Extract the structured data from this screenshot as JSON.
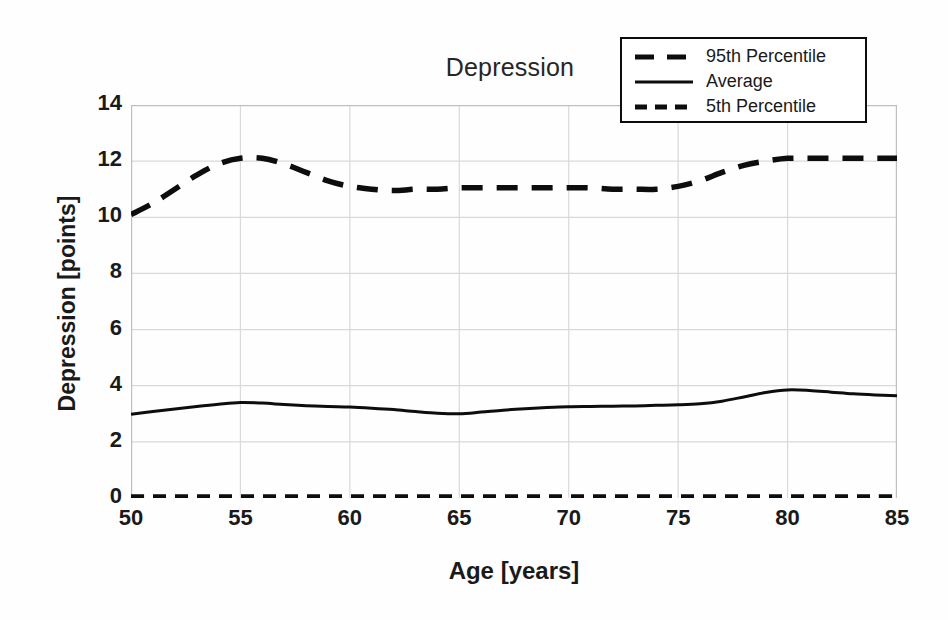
{
  "chart_data": {
    "type": "line",
    "title": "Depression",
    "xlabel": "Age [years]",
    "ylabel": "Depression [points]",
    "xlim": [
      50,
      85
    ],
    "ylim": [
      0,
      14
    ],
    "xticks": [
      "50",
      "55",
      "60",
      "65",
      "70",
      "75",
      "80",
      "85"
    ],
    "yticks": [
      "0",
      "2",
      "4",
      "6",
      "8",
      "10",
      "12",
      "14"
    ],
    "grid": "both",
    "legend_position": "top-right",
    "x": [
      50,
      51,
      52,
      53,
      54,
      55,
      56,
      57,
      58,
      59,
      60,
      61,
      62,
      63,
      64,
      65,
      66,
      67,
      68,
      69,
      70,
      71,
      72,
      73,
      74,
      75,
      76,
      77,
      78,
      79,
      80,
      81,
      82,
      83,
      84,
      85
    ],
    "series": [
      {
        "name": "95th Percentile",
        "style": "dashed-long",
        "color": "#0d0d0d",
        "values": [
          10.1,
          10.5,
          11.0,
          11.5,
          11.9,
          12.1,
          12.1,
          11.9,
          11.6,
          11.3,
          11.1,
          11.0,
          10.95,
          11.0,
          11.0,
          11.05,
          11.05,
          11.05,
          11.05,
          11.05,
          11.05,
          11.05,
          11.0,
          11.0,
          11.0,
          11.1,
          11.3,
          11.6,
          11.85,
          12.0,
          12.1,
          12.1,
          12.1,
          12.1,
          12.1,
          12.1
        ]
      },
      {
        "name": "Average",
        "style": "solid",
        "color": "#0d0d0d",
        "values": [
          2.98,
          3.08,
          3.17,
          3.26,
          3.34,
          3.4,
          3.38,
          3.33,
          3.29,
          3.26,
          3.24,
          3.2,
          3.15,
          3.08,
          3.02,
          3.0,
          3.06,
          3.13,
          3.18,
          3.22,
          3.25,
          3.26,
          3.27,
          3.28,
          3.3,
          3.32,
          3.36,
          3.45,
          3.6,
          3.76,
          3.85,
          3.83,
          3.77,
          3.71,
          3.67,
          3.64
        ]
      },
      {
        "name": "5th Percentile",
        "style": "dashed-short",
        "color": "#0d0d0d",
        "values": [
          0.04,
          0.04,
          0.04,
          0.04,
          0.04,
          0.04,
          0.04,
          0.04,
          0.04,
          0.04,
          0.04,
          0.04,
          0.04,
          0.04,
          0.04,
          0.04,
          0.04,
          0.04,
          0.04,
          0.04,
          0.04,
          0.04,
          0.04,
          0.04,
          0.04,
          0.04,
          0.04,
          0.04,
          0.04,
          0.04,
          0.04,
          0.04,
          0.04,
          0.04,
          0.04,
          0.04
        ]
      }
    ],
    "colors": {
      "line": "#0d0d0d",
      "grid": "#d9d9d9",
      "axis": "#bfbfbf",
      "text": "#1a1a1a",
      "background": "#fefefe"
    }
  },
  "legend": {
    "items": [
      {
        "label": "95th Percentile"
      },
      {
        "label": "Average"
      },
      {
        "label": "5th Percentile"
      }
    ]
  }
}
